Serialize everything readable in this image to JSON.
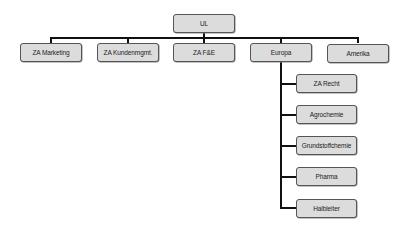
{
  "diagram": {
    "type": "org-chart",
    "colors": {
      "box_fill": "#dcdcdc",
      "box_border": "#555555",
      "connector": "#111111",
      "text": "#222222",
      "background": "#ffffff"
    },
    "root": {
      "label": "UL"
    },
    "level1": [
      {
        "label": "ZA Marketing"
      },
      {
        "label": "ZA Kundenmgmt."
      },
      {
        "label": "ZA F&E"
      },
      {
        "label": "Europa"
      },
      {
        "label": "Amerika"
      }
    ],
    "europa_children": [
      {
        "label": "ZA Recht"
      },
      {
        "label": "Agrochemie"
      },
      {
        "label": "Grundstoffchemie"
      },
      {
        "label": "Pharma"
      },
      {
        "label": "Halbleiter"
      }
    ]
  }
}
